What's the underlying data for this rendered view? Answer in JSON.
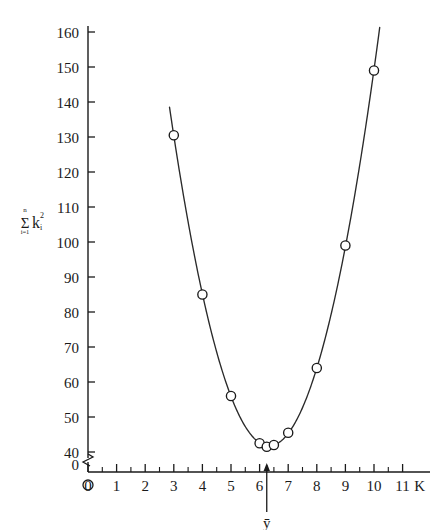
{
  "chart_data": {
    "type": "scatter",
    "title": "",
    "subtitle": "",
    "xlabel": "K",
    "ylabel": "sum i=1 to n of k_i^2",
    "ylabel_parts": {
      "sigma": "Σ",
      "upper_limit": "n",
      "lower_limit": "i=1",
      "variable": "k",
      "superscript": "2",
      "subscript": "i"
    },
    "x": [
      3,
      4,
      5,
      6,
      6.25,
      6.5,
      7,
      8,
      9,
      10
    ],
    "values": [
      130.5,
      85,
      56,
      42.5,
      41.5,
      42,
      45.5,
      64,
      99,
      149
    ],
    "series": [
      {
        "name": "observed",
        "marker": "open-circle",
        "points": [
          {
            "x": 3,
            "y": 130.5
          },
          {
            "x": 4,
            "y": 85
          },
          {
            "x": 5,
            "y": 56
          },
          {
            "x": 6,
            "y": 42.5
          },
          {
            "x": 6.25,
            "y": 41.5
          },
          {
            "x": 6.5,
            "y": 42
          },
          {
            "x": 7,
            "y": 45.5
          },
          {
            "x": 8,
            "y": 64
          },
          {
            "x": 9,
            "y": 99
          },
          {
            "x": 10,
            "y": 149
          }
        ]
      }
    ],
    "fitted_curve": {
      "type": "parabola",
      "x_start": 2.85,
      "x_end": 10.2,
      "vertex_x": 6.25,
      "vertex_y": 41.5
    },
    "xlim": [
      0,
      11.6
    ],
    "ylim": [
      40,
      163
    ],
    "y_axis_break": {
      "present": true,
      "between": [
        0,
        40
      ],
      "symbol": "zigzag"
    },
    "xticks": [
      0,
      1,
      2,
      3,
      4,
      5,
      6,
      7,
      8,
      9,
      10,
      11
    ],
    "xticklabels": [
      "0",
      "1",
      "2",
      "3",
      "4",
      "5",
      "6",
      "7",
      "8",
      "9",
      "10",
      "11"
    ],
    "xminorticks": [
      0.5,
      1.5,
      2.5,
      3.5,
      4.5,
      5.5,
      6.5,
      7.5,
      8.5,
      9.5,
      10.5
    ],
    "yticks": [
      40,
      50,
      60,
      70,
      80,
      90,
      100,
      110,
      120,
      130,
      140,
      150,
      160
    ],
    "yticklabels": [
      "40",
      "50",
      "60",
      "70",
      "80",
      "90",
      "100",
      "110",
      "120",
      "130",
      "140",
      "150",
      "160"
    ],
    "y_origin_label": "0",
    "grid": false,
    "legend": null,
    "annotations": [
      {
        "name": "y-bar-arrow",
        "label": "ȳ",
        "x": 6.25,
        "description": "upward arrow on x-axis marking the mean",
        "arrow": true
      }
    ],
    "axis_color": "#1a1a1a",
    "marker_color": "#1a1a1a",
    "curve_color": "#2a2a2a",
    "background": "#ffffff"
  }
}
